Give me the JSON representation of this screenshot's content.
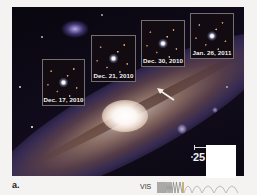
{
  "figure": {
    "panel_label": "a.",
    "insets": [
      {
        "label": "Dec. 17, 2010"
      },
      {
        "label": "Dec. 21, 2010"
      },
      {
        "label": "Dec. 30, 2010"
      },
      {
        "label": "Jan. 26, 2011"
      }
    ],
    "arrow": {
      "icon": "arrow-pointing-up-left-icon"
    },
    "scale_bar": {
      "label": "25"
    },
    "spectrum": {
      "label": "VIS"
    }
  },
  "colors": {
    "page_background": "#f4f3f1",
    "sky": "#0e0a18",
    "inset_label": "#f2f0ee",
    "overlay_block": "#ffffff"
  }
}
